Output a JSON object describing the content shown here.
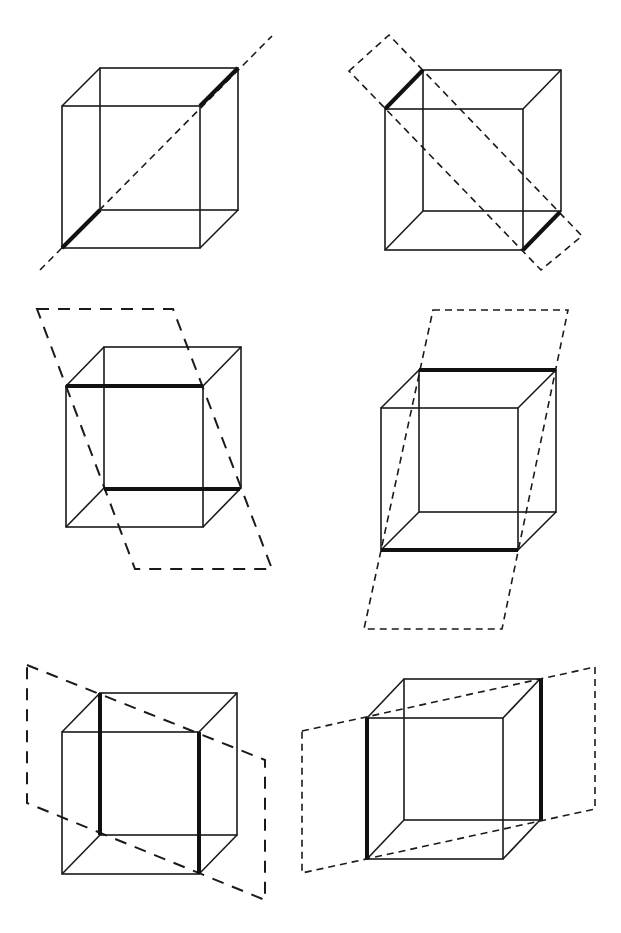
{
  "figure": {
    "panels": [
      {
        "id": 1,
        "front": [
          62,
          106,
          200,
          248
        ],
        "back_offset": [
          38,
          -38
        ],
        "thick_edges": [
          [
            62,
            248,
            100,
            210
          ],
          [
            200,
            106,
            238,
            68
          ]
        ],
        "cut": {
          "type": "line",
          "points": [
            [
              40,
              270
            ],
            [
              272,
              36
            ]
          ]
        }
      },
      {
        "id": 2,
        "front": [
          385,
          109,
          523,
          250
        ],
        "back_offset": [
          38,
          -39
        ],
        "thick_edges": [
          [
            385,
            109,
            423,
            70
          ],
          [
            523,
            250,
            560,
            212
          ]
        ],
        "cut": {
          "type": "plane",
          "points": [
            [
              349,
              71
            ],
            [
              389,
              35
            ],
            [
              582,
              236
            ],
            [
              541,
              270
            ]
          ]
        }
      },
      {
        "id": 3,
        "front": [
          66,
          386,
          203,
          527
        ],
        "back_offset": [
          38,
          -39
        ],
        "thick_edges": [
          [
            66,
            386,
            203,
            386
          ],
          [
            104,
            489,
            240,
            489
          ]
        ],
        "cut": {
          "type": "plane",
          "points": [
            [
              37,
              309
            ],
            [
              173,
              309
            ],
            [
              272,
              569
            ],
            [
              135,
              569
            ]
          ]
        }
      },
      {
        "id": 4,
        "front": [
          381,
          408,
          518,
          550
        ],
        "back_offset": [
          38,
          -38
        ],
        "thick_edges": [
          [
            419,
            370,
            556,
            370
          ],
          [
            381,
            550,
            518,
            550
          ]
        ],
        "cut": {
          "type": "plane",
          "points": [
            [
              433,
              310
            ],
            [
              568,
              310
            ],
            [
              502,
              629
            ],
            [
              364,
              629
            ]
          ]
        }
      },
      {
        "id": 5,
        "front": [
          62,
          732,
          199,
          874
        ],
        "back_offset": [
          38,
          -39
        ],
        "thick_edges": [
          [
            100,
            693,
            100,
            835
          ],
          [
            199,
            732,
            199,
            874
          ]
        ],
        "cut": {
          "type": "plane",
          "points": [
            [
              27,
              665
            ],
            [
              265,
              760
            ],
            [
              265,
              900
            ],
            [
              27,
              803
            ]
          ]
        }
      },
      {
        "id": 6,
        "front": [
          367,
          718,
          503,
          859
        ],
        "back_offset": [
          37,
          -39
        ],
        "thick_edges": [
          [
            367,
            718,
            367,
            859
          ],
          [
            541,
            679,
            541,
            820
          ]
        ],
        "cut": {
          "type": "plane",
          "points": [
            [
              302,
              731
            ],
            [
              595,
              667
            ],
            [
              595,
              809
            ],
            [
              302,
              873
            ]
          ]
        }
      }
    ]
  }
}
